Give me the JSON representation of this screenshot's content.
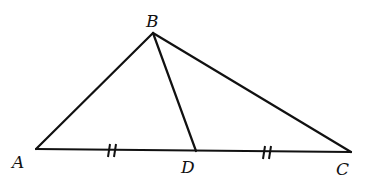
{
  "diagram": {
    "type": "triangle-with-median",
    "stroke_color": "#111111",
    "background": "#ffffff",
    "points": {
      "A": {
        "label": "A",
        "x": 36,
        "y": 149,
        "label_x": 12,
        "label_y": 168
      },
      "B": {
        "label": "B",
        "x": 153,
        "y": 33,
        "label_x": 146,
        "label_y": 27
      },
      "C": {
        "label": "C",
        "x": 351,
        "y": 152,
        "label_x": 336,
        "label_y": 175
      },
      "D": {
        "label": "D",
        "x": 196,
        "y": 151,
        "label_x": 181,
        "label_y": 173
      }
    },
    "segments": [
      {
        "name": "AB",
        "from": "A",
        "to": "B"
      },
      {
        "name": "BC",
        "from": "B",
        "to": "C"
      },
      {
        "name": "AC",
        "from": "A",
        "to": "C"
      },
      {
        "name": "BD",
        "from": "B",
        "to": "D"
      }
    ],
    "congruence_marks": [
      {
        "segment": "AD",
        "type": "double-tick",
        "x": 113,
        "y": 150
      },
      {
        "segment": "DC",
        "type": "double-tick",
        "x": 267,
        "y": 152
      }
    ]
  }
}
